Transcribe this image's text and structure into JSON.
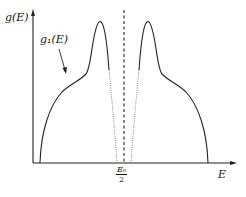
{
  "figure": {
    "y_axis_label": "g(E)",
    "x_axis_label": "E",
    "curve_label": "g₁(E)",
    "center_tick": {
      "numerator": "E₀",
      "denominator": "2"
    },
    "colors": {
      "line": "#222222",
      "background": "#ffffff"
    }
  },
  "diagram": {
    "type": "symmetric density of states curve",
    "elements": [
      "vertical axis g(E) with arrow",
      "horizontal axis E with arrow",
      "dashed vertical line at E0/2",
      "left branch: rise, shoulder, sharp peak, dotted tail toward center",
      "right branch: mirror image",
      "arrow pointing from label g1(E) to left shoulder"
    ]
  }
}
